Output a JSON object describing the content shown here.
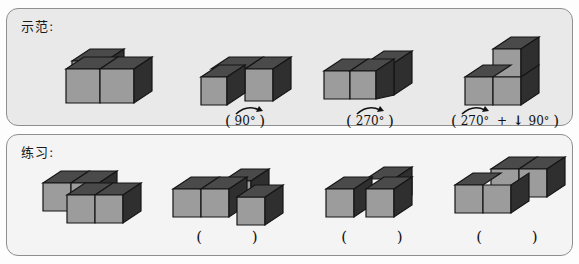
{
  "page": {
    "background": "#fdfdfd",
    "panel_fill": "#e9e9e9",
    "panel_fill_alt": "#f4f4f4",
    "panel_border": "#8f8f8f",
    "cube_top": "#4a4a4a",
    "cube_front": "#9c9c9c",
    "cube_side": "#2f2f2f",
    "cube_edge": "#1a1a1a"
  },
  "demo": {
    "label": "示范:",
    "items": [
      {
        "name": "demo-shape-original",
        "caption": null,
        "rotation_value": null,
        "degree_symbol": null
      },
      {
        "name": "demo-shape-rot90",
        "caption_open": "(",
        "rotation_value": "90",
        "degree_symbol": "°",
        "caption_close": ")",
        "arrow": "curved-rotation-arrow"
      },
      {
        "name": "demo-shape-rot270",
        "caption_open": "(",
        "rotation_value": "270",
        "degree_symbol": "°",
        "caption_close": ")",
        "arrow": "curved-rotation-arrow"
      },
      {
        "name": "demo-shape-rot270-plus-down90",
        "caption_open": "(",
        "rotation_value": "270",
        "degree_symbol": "°",
        "plus": "+",
        "down_arrow": "↓",
        "second_value": "90",
        "second_degree": "°",
        "caption_close": ")",
        "arrow": "curved-rotation-arrow"
      }
    ]
  },
  "practice": {
    "label": "练习:",
    "items": [
      {
        "name": "practice-shape-1",
        "caption_open": null,
        "caption_close": null
      },
      {
        "name": "practice-shape-2",
        "caption_open": "(",
        "caption_close": ")",
        "answer": ""
      },
      {
        "name": "practice-shape-3",
        "caption_open": "(",
        "caption_close": ")",
        "answer": ""
      },
      {
        "name": "practice-shape-4",
        "caption_open": "(",
        "caption_close": ")",
        "answer": ""
      }
    ]
  }
}
